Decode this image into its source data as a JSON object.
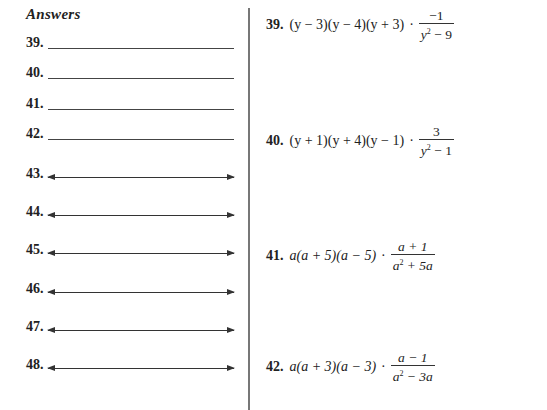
{
  "answers": {
    "heading": "Answers",
    "blank_items": [
      {
        "number": "39."
      },
      {
        "number": "40."
      },
      {
        "number": "41."
      },
      {
        "number": "42."
      }
    ],
    "graph_items": [
      {
        "number": "43."
      },
      {
        "number": "44."
      },
      {
        "number": "45."
      },
      {
        "number": "46."
      },
      {
        "number": "47."
      },
      {
        "number": "48."
      }
    ]
  },
  "problems": [
    {
      "number": "39.",
      "factors": "(y − 3)(y − 4)(y + 3)",
      "numerator": "−1",
      "denominator_base": "y",
      "denominator_exp": "2",
      "denominator_rest": " − 9"
    },
    {
      "number": "40.",
      "factors": "(y + 1)(y + 4)(y − 1)",
      "numerator": "3",
      "denominator_base": "y",
      "denominator_exp": "2",
      "denominator_rest": " − 1"
    },
    {
      "number": "41.",
      "factors": "a(a + 5)(a − 5)",
      "numerator": "a + 1",
      "denominator_base": "a",
      "denominator_exp": "2",
      "denominator_rest": " + 5a"
    },
    {
      "number": "42.",
      "factors": "a(a + 3)(a − 3)",
      "numerator": "a − 1",
      "denominator_base": "a",
      "denominator_exp": "2",
      "denominator_rest": " − 3a"
    }
  ],
  "symbols": {
    "times_dot": "·"
  }
}
